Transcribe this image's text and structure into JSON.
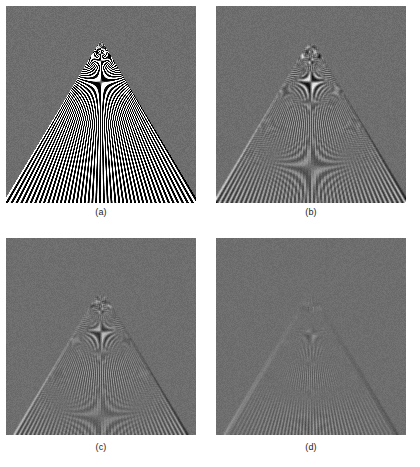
{
  "figure": {
    "type": "image-panel-figure",
    "width": 420,
    "height": 467,
    "page_background": "#ffffff",
    "panel_background_gray": "#6e6e6e"
  },
  "panels": [
    {
      "id": "a",
      "caption": "(a)",
      "x": 6,
      "y": 6,
      "width": 190,
      "height": 197,
      "caption_y": 206,
      "apex_x_frac": 0.5,
      "apex_y_frac": 0.17,
      "half_angle_deg": 31,
      "num_lines": 46,
      "blur_px": 0.0,
      "noise_amp": 16,
      "aliasing_strength": 1.0,
      "contrast": 1.0,
      "base_gray": 110,
      "description": "sharp, heavy aliasing / moire near apex"
    },
    {
      "id": "b",
      "caption": "(b)",
      "x": 216,
      "y": 6,
      "width": 190,
      "height": 197,
      "caption_y": 206,
      "apex_x_frac": 0.5,
      "apex_y_frac": 0.17,
      "half_angle_deg": 31,
      "num_lines": 46,
      "blur_px": 0.35,
      "noise_amp": 15,
      "aliasing_strength": 0.85,
      "contrast": 0.96,
      "base_gray": 110,
      "description": "slightly smoothed, aliasing still visible near apex"
    },
    {
      "id": "c",
      "caption": "(c)",
      "x": 6,
      "y": 238,
      "width": 190,
      "height": 197,
      "caption_y": 441,
      "apex_x_frac": 0.5,
      "apex_y_frac": 0.26,
      "half_angle_deg": 31,
      "num_lines": 46,
      "blur_px": 0.9,
      "noise_amp": 14,
      "aliasing_strength": 0.5,
      "contrast": 0.92,
      "base_gray": 110,
      "description": "moderately low-pass filtered, reduced moire"
    },
    {
      "id": "d",
      "caption": "(d)",
      "x": 216,
      "y": 238,
      "width": 190,
      "height": 197,
      "caption_y": 441,
      "apex_x_frac": 0.5,
      "apex_y_frac": 0.27,
      "half_angle_deg": 31,
      "num_lines": 46,
      "blur_px": 1.7,
      "noise_amp": 13,
      "aliasing_strength": 0.18,
      "contrast": 0.86,
      "base_gray": 110,
      "description": "strongly low-pass filtered, aliasing largely removed"
    }
  ],
  "chart_data": {
    "type": "heatmap",
    "title": "",
    "xlabel": "",
    "ylabel": "",
    "series": [
      {
        "name": "(a)",
        "values": [
          1.0,
          0.0
        ]
      },
      {
        "name": "(b)",
        "values": [
          0.85,
          0.35
        ]
      },
      {
        "name": "(c)",
        "values": [
          0.5,
          0.9
        ]
      },
      {
        "name": "(d)",
        "values": [
          0.18,
          1.7
        ]
      }
    ],
    "categories": [
      "aliasing_strength",
      "blur_px"
    ]
  }
}
